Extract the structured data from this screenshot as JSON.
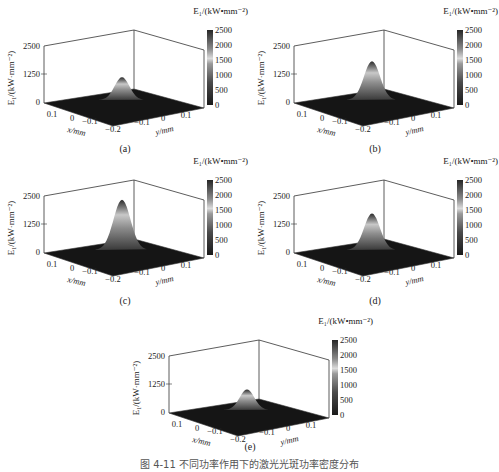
{
  "chart_data": [
    {
      "type": "surface",
      "panel": "(a)",
      "title": "",
      "zlabel": "E1/(kW·mm^-2)",
      "xlabel": "x/mm",
      "ylabel": "y/mm",
      "zticks": [
        0,
        1250,
        2500
      ],
      "xticks": [
        0.1,
        0,
        -0.1,
        -0.2
      ],
      "yticks": [
        -0.1,
        0,
        0.1
      ],
      "zlim": [
        0,
        2500
      ],
      "colorbar": {
        "label": "E1/(kW·mm^-2)",
        "ticks": [
          0,
          500,
          1000,
          1500,
          2000,
          2500
        ]
      },
      "peak_value": 1000
    },
    {
      "type": "surface",
      "panel": "(b)",
      "zlabel": "E1/(kW·mm^-2)",
      "xlabel": "x/mm",
      "ylabel": "y/mm",
      "zticks": [
        0,
        1250,
        2500
      ],
      "xticks": [
        0.1,
        0,
        -0.1,
        -0.2
      ],
      "yticks": [
        -0.1,
        0,
        0.1
      ],
      "zlim": [
        0,
        2500
      ],
      "colorbar": {
        "label": "E1/(kW·mm^-2)",
        "ticks": [
          0,
          500,
          1000,
          1500,
          2000,
          2500
        ]
      },
      "peak_value": 1700
    },
    {
      "type": "surface",
      "panel": "(c)",
      "zlabel": "E1/(kW·mm^-2)",
      "xlabel": "x/mm",
      "ylabel": "y/mm",
      "zticks": [
        0,
        1250,
        2500
      ],
      "xticks": [
        0.1,
        0,
        -0.1,
        -0.2
      ],
      "yticks": [
        -0.1,
        0,
        0.1
      ],
      "zlim": [
        0,
        2500
      ],
      "colorbar": {
        "label": "E1/(kW·mm^-2)",
        "ticks": [
          0,
          500,
          1000,
          1500,
          2000,
          2500
        ]
      },
      "peak_value": 2200
    },
    {
      "type": "surface",
      "panel": "(d)",
      "zlabel": "E1/(kW·mm^-2)",
      "xlabel": "x/mm",
      "ylabel": "y/mm",
      "zticks": [
        0,
        1250,
        2500
      ],
      "xticks": [
        0.1,
        0,
        -0.1,
        -0.2
      ],
      "yticks": [
        -0.1,
        0,
        0.1
      ],
      "zlim": [
        0,
        2500
      ],
      "colorbar": {
        "label": "E1/(kW·mm^-2)",
        "ticks": [
          0,
          500,
          1000,
          1500,
          2000,
          2500
        ]
      },
      "peak_value": 1600
    },
    {
      "type": "surface",
      "panel": "(e)",
      "zlabel": "E1/(kW·mm^-2)",
      "xlabel": "x/mm",
      "ylabel": "y/mm",
      "zticks": [
        0,
        1250,
        2500
      ],
      "xticks": [
        0.1,
        0,
        -0.1,
        -0.2
      ],
      "yticks": [
        -0.1,
        0,
        0.1
      ],
      "zlim": [
        0,
        2500
      ],
      "colorbar": {
        "label": "E1/(kW·mm^-2)",
        "ticks": [
          0,
          500,
          1000,
          1500,
          2000,
          2500
        ]
      },
      "peak_value": 900
    }
  ],
  "labels": {
    "zaxis": "E₁/(kW·mm⁻²)",
    "colorbar_title": "E₁/(kW•mm⁻²)",
    "x_axis": "x/mm",
    "y_axis": "y/mm",
    "z_ticks": [
      "2500",
      "1250",
      "0"
    ],
    "x_ticks": [
      "0.1",
      "0",
      "−0.1",
      "−0.2"
    ],
    "y_ticks": [
      "−0.1",
      "0",
      "0.1"
    ],
    "cb_ticks": [
      "2500",
      "2000",
      "1500",
      "1000",
      "500",
      "0"
    ]
  },
  "panels": [
    {
      "label": "(a)",
      "peak": 1000
    },
    {
      "label": "(b)",
      "peak": 1700
    },
    {
      "label": "(c)",
      "peak": 2200
    },
    {
      "label": "(d)",
      "peak": 1600
    },
    {
      "label": "(e)",
      "peak": 900
    }
  ],
  "caption": "图 4-11  不同功率作用下的激光光斑功率密度分布"
}
